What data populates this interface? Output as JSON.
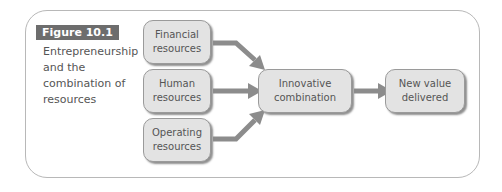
{
  "figure": {
    "label": "Figure 10.1",
    "caption": "Entrepreneurship and the combination of resources"
  },
  "diagram": {
    "inputs": [
      {
        "id": "financial",
        "label": "Financial resources"
      },
      {
        "id": "human",
        "label": "Human resources"
      },
      {
        "id": "operating",
        "label": "Operating resources"
      }
    ],
    "middle": {
      "label": "Innovative combination"
    },
    "output": {
      "label": "New value delivered"
    },
    "colors": {
      "box_fill": "#e3e3e3",
      "arrow": "#8c8c8c",
      "label_bg": "#6d6d6d"
    }
  }
}
